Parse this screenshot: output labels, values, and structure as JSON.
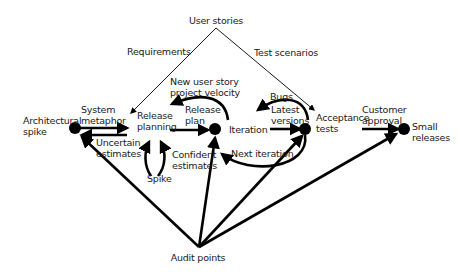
{
  "diagram": {
    "colors": {
      "stroke": "#000000",
      "text": "#1a1a1a",
      "background": "#ffffff"
    },
    "labels": {
      "user_stories": "User stories",
      "requirements": "Requirements",
      "test_scenarios": "Test scenarios",
      "new_user_story": "New user story\nproject velocity",
      "architectural_spike": "Architectural\nspike",
      "system_metaphor": "System\nmetaphor",
      "release_planning": "Release\nplanning",
      "release_plan": "Release\nplan",
      "iteration": "Iteration",
      "bugs": "Bugs",
      "latest_versions": "Latest\nversions",
      "acceptance_tests": "Acceptance\ntests",
      "customer_approval": "Customer\napproval",
      "small_releases": "Small\nreleases",
      "uncertain_estimates": "Uncertain\nestimates",
      "confident_estimates": "Confident\nestimates",
      "spike": "Spike",
      "next_iteration": "Next iteration",
      "audit_points": "Audit points"
    },
    "nodes": [
      {
        "id": "architectural-spike",
        "x": 75,
        "y": 127
      },
      {
        "id": "iteration",
        "x": 215,
        "y": 128
      },
      {
        "id": "acceptance-tests",
        "x": 305,
        "y": 128
      },
      {
        "id": "small-releases",
        "x": 404,
        "y": 128
      }
    ]
  }
}
